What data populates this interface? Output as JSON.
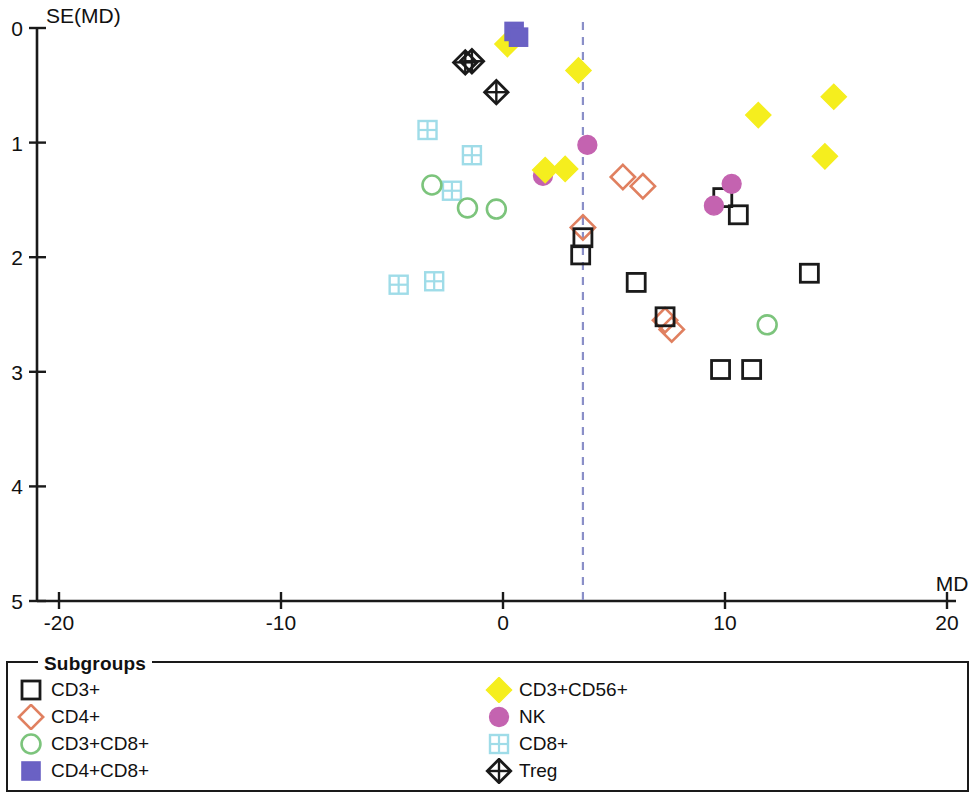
{
  "chart_data": {
    "type": "scatter",
    "title": "",
    "xlabel": "MD",
    "ylabel": "SE(MD)",
    "xlim": [
      -20,
      20
    ],
    "ylim": [
      0,
      5
    ],
    "y_axis_inverted": true,
    "grid": false,
    "x_ticks": [
      "-20",
      "-10",
      "0",
      "10",
      "20"
    ],
    "x_tick_values": [
      -20,
      -10,
      0,
      10,
      20
    ],
    "y_ticks": [
      "0",
      "1",
      "2",
      "3",
      "4",
      "5"
    ],
    "y_tick_values": [
      0,
      1,
      2,
      3,
      4,
      5
    ],
    "reference_line": {
      "orientation": "vertical",
      "value": 3.6,
      "style": "dashed",
      "color": "#8a8fc8"
    },
    "legend_position": "below-plot",
    "legend_title": "Subgroups",
    "series": [
      {
        "name": "CD3+",
        "marker": "open-square",
        "color": "#1a1a1a",
        "fill": "none",
        "points": [
          {
            "x": 3.6,
            "y": 1.83
          },
          {
            "x": 3.5,
            "y": 1.98
          },
          {
            "x": 6.0,
            "y": 2.22
          },
          {
            "x": 7.3,
            "y": 2.52
          },
          {
            "x": 9.9,
            "y": 1.48
          },
          {
            "x": 10.6,
            "y": 1.63
          },
          {
            "x": 13.8,
            "y": 2.14
          },
          {
            "x": 9.8,
            "y": 2.98
          },
          {
            "x": 11.2,
            "y": 2.98
          }
        ]
      },
      {
        "name": "CD4+",
        "marker": "open-diamond",
        "color": "#e08060",
        "fill": "none",
        "points": [
          {
            "x": 5.4,
            "y": 1.3
          },
          {
            "x": 6.3,
            "y": 1.38
          },
          {
            "x": 3.6,
            "y": 1.74
          },
          {
            "x": 7.3,
            "y": 2.55
          },
          {
            "x": 7.6,
            "y": 2.63
          }
        ]
      },
      {
        "name": "CD3+CD8+",
        "marker": "open-circle",
        "color": "#7cc47c",
        "fill": "none",
        "points": [
          {
            "x": -3.2,
            "y": 1.37
          },
          {
            "x": -1.6,
            "y": 1.57
          },
          {
            "x": -0.3,
            "y": 1.58
          },
          {
            "x": 11.9,
            "y": 2.59
          }
        ]
      },
      {
        "name": "CD4+CD8+",
        "marker": "filled-square",
        "color": "#6a61c4",
        "fill": "#6a61c4",
        "points": [
          {
            "x": 0.5,
            "y": 0.03
          },
          {
            "x": 0.7,
            "y": 0.08
          }
        ]
      },
      {
        "name": "CD3+CD56+",
        "marker": "filled-diamond",
        "color": "#f5ee1e",
        "fill": "#f5ee1e",
        "points": [
          {
            "x": 0.2,
            "y": 0.14
          },
          {
            "x": 3.4,
            "y": 0.37
          },
          {
            "x": 1.9,
            "y": 1.24
          },
          {
            "x": 2.8,
            "y": 1.23
          },
          {
            "x": 11.5,
            "y": 0.76
          },
          {
            "x": 14.9,
            "y": 0.6
          },
          {
            "x": 14.5,
            "y": 1.12
          }
        ]
      },
      {
        "name": "NK",
        "marker": "filled-circle",
        "color": "#c463b0",
        "fill": "#c463b0",
        "points": [
          {
            "x": 1.8,
            "y": 1.29
          },
          {
            "x": 3.8,
            "y": 1.02
          },
          {
            "x": 10.3,
            "y": 1.36
          },
          {
            "x": 9.5,
            "y": 1.55
          }
        ]
      },
      {
        "name": "CD8+",
        "marker": "grid-square",
        "color": "#9fdce8",
        "fill": "none",
        "points": [
          {
            "x": -3.4,
            "y": 0.89
          },
          {
            "x": -1.4,
            "y": 1.11
          },
          {
            "x": -2.3,
            "y": 1.42
          },
          {
            "x": -4.7,
            "y": 2.24
          },
          {
            "x": -3.1,
            "y": 2.21
          }
        ]
      },
      {
        "name": "Treg",
        "marker": "diamond-cross",
        "color": "#1a1a1a",
        "fill": "none",
        "points": [
          {
            "x": -1.7,
            "y": 0.3
          },
          {
            "x": -1.4,
            "y": 0.29
          },
          {
            "x": -0.3,
            "y": 0.56
          }
        ]
      }
    ]
  },
  "axes": {
    "y_label": "SE(MD)",
    "x_label": "MD",
    "y_tick_labels": [
      "0",
      "1",
      "2",
      "3",
      "4",
      "5"
    ],
    "x_tick_labels": [
      "-20",
      "-10",
      "0",
      "10",
      "20"
    ]
  },
  "legend": {
    "title": "Subgroups",
    "left_column": [
      {
        "label": "CD3+",
        "marker": "open-square"
      },
      {
        "label": "CD4+",
        "marker": "open-diamond"
      },
      {
        "label": "CD3+CD8+",
        "marker": "open-circle"
      },
      {
        "label": "CD4+CD8+",
        "marker": "filled-square"
      }
    ],
    "right_column": [
      {
        "label": "CD3+CD56+",
        "marker": "filled-diamond"
      },
      {
        "label": "NK",
        "marker": "filled-circle"
      },
      {
        "label": "CD8+",
        "marker": "grid-square"
      },
      {
        "label": "Treg",
        "marker": "diamond-cross"
      }
    ]
  },
  "colors": {
    "cd3": "#1a1a1a",
    "cd4": "#e08060",
    "cd3cd8": "#7cc47c",
    "cd4cd8": "#6a61c4",
    "cd3cd56": "#f5ee1e",
    "nk": "#c463b0",
    "cd8": "#9fdce8",
    "treg": "#1a1a1a",
    "reference_line": "#8a8fc8",
    "axis": "#1a1a1a"
  }
}
